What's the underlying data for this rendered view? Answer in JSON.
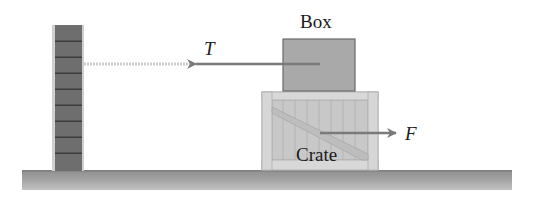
{
  "diagram": {
    "type": "physics-free-body-setup",
    "objects": {
      "wall": {
        "label": "",
        "bricks": 9
      },
      "box": {
        "label": "Box"
      },
      "crate": {
        "label": "Crate"
      },
      "ground": {
        "label": ""
      }
    },
    "forces": {
      "tension": {
        "label": "T",
        "direction": "left"
      },
      "applied": {
        "label": "F",
        "direction": "right"
      }
    },
    "colors": {
      "wall_brick": "#6e6e6e",
      "wall_mortar": "#3c3c3c",
      "wall_edge": "#b8b8b8",
      "box_fill": "#a9a9a9",
      "box_border": "#6a6a6a",
      "crate_fill": "#cfcfcf",
      "crate_plank": "#b9b9b9",
      "crate_border": "#9a9a9a",
      "ground": "#a0a0a0",
      "arrow": "#7a7a7a",
      "rope": "#c9c9c9",
      "text": "#1a1a1a"
    }
  }
}
